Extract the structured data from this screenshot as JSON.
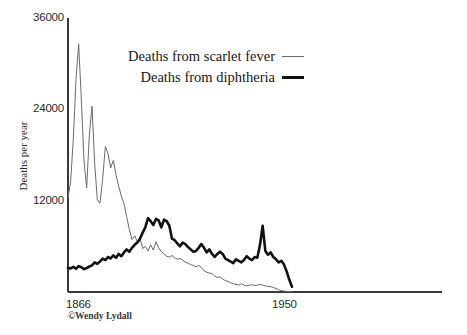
{
  "chart_data": {
    "type": "line",
    "title": "",
    "xlabel": "",
    "ylabel": "Deaths per year",
    "xlim": [
      1866,
      1950
    ],
    "ylim": [
      0,
      36000
    ],
    "grid": false,
    "legend_position": "top-center",
    "y_ticks": [
      {
        "value": 36000,
        "label": "36000"
      },
      {
        "value": 24000,
        "label": "24000"
      },
      {
        "value": 12000,
        "label": "12000"
      }
    ],
    "x_ticks": [
      {
        "value": 1866,
        "label": "1866"
      },
      {
        "value": 1950,
        "label": "1950"
      }
    ],
    "annotations": [
      "©Wendy Lydall"
    ],
    "x": [
      1866,
      1867,
      1868,
      1869,
      1870,
      1871,
      1872,
      1873,
      1874,
      1875,
      1876,
      1877,
      1878,
      1879,
      1880,
      1881,
      1882,
      1883,
      1884,
      1885,
      1886,
      1887,
      1888,
      1889,
      1890,
      1891,
      1892,
      1893,
      1894,
      1895,
      1896,
      1897,
      1898,
      1899,
      1900,
      1901,
      1902,
      1903,
      1904,
      1905,
      1906,
      1907,
      1908,
      1909,
      1910,
      1911,
      1912,
      1913,
      1914,
      1915,
      1916,
      1917,
      1918,
      1919,
      1920,
      1921,
      1922,
      1923,
      1924,
      1925,
      1926,
      1927,
      1928,
      1929,
      1930,
      1931,
      1932,
      1933,
      1934,
      1935,
      1936,
      1937,
      1938,
      1939,
      1940,
      1941,
      1942,
      1943,
      1944,
      1945,
      1946,
      1947,
      1948,
      1949,
      1950
    ],
    "series": [
      {
        "name": "Deaths from scarlet fever",
        "style": "thin",
        "color": "#6b6b6b",
        "linewidth": 1,
        "values": [
          12400,
          14500,
          20200,
          27900,
          32600,
          25300,
          17200,
          13700,
          20600,
          24400,
          16900,
          12100,
          11700,
          14900,
          19100,
          18200,
          16300,
          17300,
          15400,
          13900,
          12600,
          11600,
          9900,
          8200,
          6900,
          7400,
          6600,
          7000,
          5700,
          6000,
          5400,
          6200,
          5500,
          6600,
          5800,
          5300,
          5000,
          4700,
          4600,
          4800,
          4500,
          4300,
          4400,
          4200,
          3900,
          3800,
          3600,
          3500,
          3300,
          3500,
          3200,
          2800,
          2600,
          2500,
          2400,
          2100,
          1900,
          2000,
          1700,
          1500,
          1400,
          1200,
          1100,
          1000,
          900,
          1100,
          900,
          800,
          900,
          950,
          850,
          900,
          1000,
          900,
          800,
          750,
          700,
          600,
          450,
          300,
          200,
          120,
          80,
          40,
          20
        ]
      },
      {
        "name": "Deaths from diphtheria",
        "style": "thick",
        "color": "#111111",
        "linewidth": 2.6,
        "values": [
          3200,
          3100,
          3300,
          3050,
          3400,
          3250,
          3000,
          3150,
          3350,
          3500,
          3900,
          3700,
          4000,
          4400,
          4200,
          4600,
          4400,
          4800,
          4500,
          5000,
          4700,
          5200,
          5600,
          5300,
          5800,
          6200,
          6500,
          7000,
          7800,
          8500,
          9700,
          9300,
          8800,
          9600,
          9400,
          8500,
          9500,
          9300,
          8700,
          7000,
          6800,
          6400,
          6000,
          6500,
          6300,
          5900,
          5600,
          5300,
          5400,
          5800,
          6300,
          5800,
          5200,
          5600,
          5000,
          4600,
          5000,
          5300,
          5000,
          4400,
          4200,
          4000,
          3800,
          4300,
          4100,
          3900,
          4200,
          4700,
          4400,
          4200,
          4600,
          4500,
          6200,
          8700,
          5400,
          4900,
          5200,
          4600,
          4300,
          3900,
          4100,
          3600,
          2700,
          1600,
          700
        ]
      }
    ]
  },
  "axis": {
    "ylabel": "Deaths per year"
  },
  "legend": {
    "items": [
      {
        "label": "Deaths from scarlet fever",
        "style": "thin"
      },
      {
        "label": "Deaths from diphtheria",
        "style": "thick"
      }
    ]
  },
  "footer": {
    "copyright": "©Wendy Lydall"
  }
}
